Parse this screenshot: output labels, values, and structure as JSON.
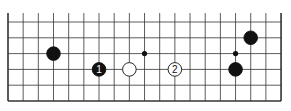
{
  "diagram": {
    "type": "go-board-fragment",
    "columns": 19,
    "rows": 6,
    "edges": [
      "left",
      "right",
      "bottom"
    ],
    "origin_x": 8,
    "origin_y": 22,
    "spacing_x": 15.17,
    "spacing_y": 15.8,
    "colors": {
      "line": "#333333",
      "black": "#111111",
      "white": "#ffffff",
      "background": "#ffffff"
    },
    "star_points": [
      {
        "col": 9,
        "row": 2
      },
      {
        "col": 15,
        "row": 2
      }
    ],
    "stones": [
      {
        "color": "black",
        "col": 3,
        "row": 2,
        "label": ""
      },
      {
        "color": "black",
        "col": 6,
        "row": 3,
        "label": "1"
      },
      {
        "color": "white",
        "col": 8,
        "row": 3,
        "label": ""
      },
      {
        "color": "white",
        "col": 11,
        "row": 3,
        "label": "2"
      },
      {
        "color": "black",
        "col": 15,
        "row": 3,
        "label": ""
      },
      {
        "color": "black",
        "col": 16,
        "row": 1,
        "label": ""
      }
    ]
  }
}
